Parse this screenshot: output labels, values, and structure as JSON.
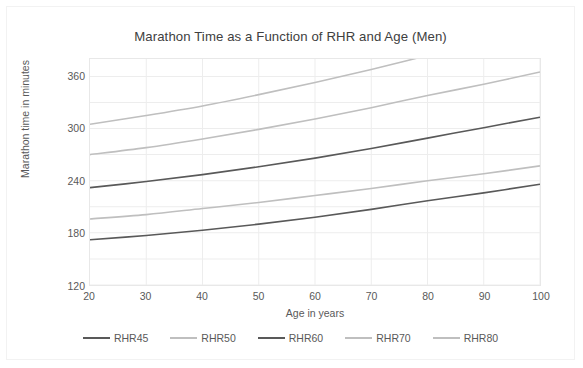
{
  "chart_data": {
    "type": "line",
    "title": "Marathon Time as a Function of RHR and Age (Men)",
    "xlabel": "Age in years",
    "ylabel": "Marathon time in minutes",
    "xlim": [
      20,
      100
    ],
    "ylim": [
      120,
      380
    ],
    "xticks": [
      20,
      30,
      40,
      50,
      60,
      70,
      80,
      90,
      100
    ],
    "yticks": [
      120,
      180,
      240,
      300,
      360
    ],
    "minor_gridline_step": 30,
    "grid": true,
    "legend_position": "bottom",
    "x": [
      20,
      30,
      40,
      50,
      60,
      70,
      80,
      90,
      100
    ],
    "series": [
      {
        "name": "RHR45",
        "color": "#595959",
        "values": [
          172,
          177,
          183,
          190,
          198,
          207,
          217,
          226,
          236
        ]
      },
      {
        "name": "RHR50",
        "color": "#bfbfbf",
        "values": [
          196,
          201,
          208,
          215,
          223,
          231,
          240,
          248,
          257
        ]
      },
      {
        "name": "RHR60",
        "color": "#595959",
        "values": [
          232,
          239,
          247,
          256,
          266,
          277,
          289,
          301,
          313
        ]
      },
      {
        "name": "RHR70",
        "color": "#bfbfbf",
        "values": [
          270,
          278,
          288,
          299,
          311,
          324,
          338,
          351,
          365
        ]
      },
      {
        "name": "RHR80",
        "color": "#bfbfbf",
        "values": [
          305,
          315,
          326,
          339,
          353,
          368,
          384,
          400,
          416
        ]
      }
    ]
  },
  "legend": {
    "items": [
      {
        "label": "RHR45",
        "color": "#595959"
      },
      {
        "label": "RHR50",
        "color": "#bfbfbf"
      },
      {
        "label": "RHR60",
        "color": "#595959"
      },
      {
        "label": "RHR70",
        "color": "#bfbfbf"
      },
      {
        "label": "RHR80",
        "color": "#bfbfbf"
      }
    ]
  },
  "colors": {
    "dark_line": "#595959",
    "light_line": "#bfbfbf",
    "grid": "#ededed",
    "axis_text": "#595959",
    "title_text": "#404040",
    "frame": "#f2f2f2"
  }
}
